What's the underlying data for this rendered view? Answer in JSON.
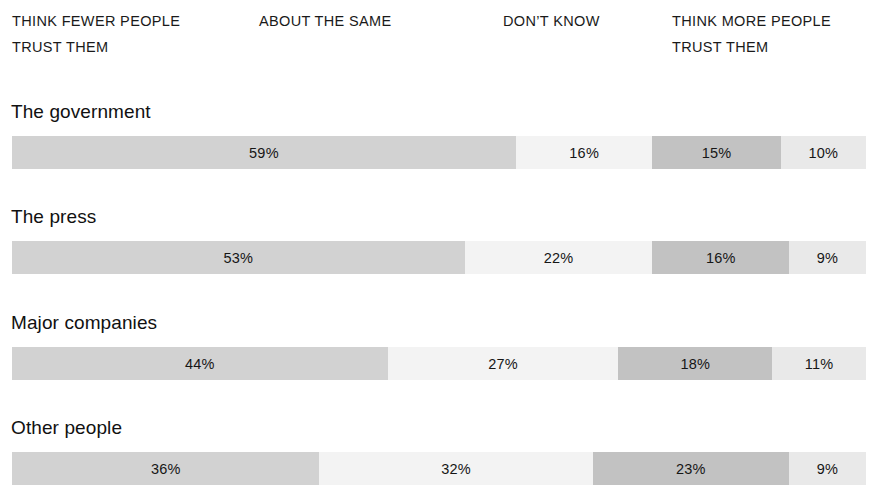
{
  "chart_data": {
    "type": "bar",
    "subtype": "stacked-horizontal-100pct",
    "title": "",
    "subtitle": "",
    "xlabel": "",
    "ylabel": "",
    "xlim": [
      0,
      100
    ],
    "grid": false,
    "legend_position": "top",
    "value_suffix": "%",
    "categories": [
      "The government",
      "The press",
      "Major companies",
      "Other people"
    ],
    "series": [
      {
        "name": "THINK FEWER PEOPLE TRUST THEM",
        "values": [
          59,
          53,
          44,
          36
        ],
        "color": "#d2d2d2"
      },
      {
        "name": "ABOUT THE SAME",
        "values": [
          16,
          22,
          27,
          32
        ],
        "color": "#f3f3f3"
      },
      {
        "name": "DON'T KNOW",
        "values": [
          15,
          16,
          18,
          23
        ],
        "color": "#c2c2c2"
      },
      {
        "name": "THINK MORE PEOPLE TRUST THEM",
        "values": [
          10,
          9,
          11,
          9
        ],
        "color": "#e9e9e9"
      }
    ]
  },
  "column_headers": [
    {
      "line1": "THINK FEWER PEOPLE",
      "line2": "TRUST THEM"
    },
    {
      "line1": "ABOUT THE SAME",
      "line2": ""
    },
    {
      "line1": "DON’T KNOW",
      "line2": ""
    },
    {
      "line1": "THINK MORE PEOPLE",
      "line2": "TRUST THEM"
    }
  ],
  "rows": [
    {
      "label": "The government",
      "segments": [
        {
          "value_label": "59%",
          "value": 59
        },
        {
          "value_label": "16%",
          "value": 16
        },
        {
          "value_label": "15%",
          "value": 15
        },
        {
          "value_label": "10%",
          "value": 10
        }
      ]
    },
    {
      "label": "The press",
      "segments": [
        {
          "value_label": "53%",
          "value": 53
        },
        {
          "value_label": "22%",
          "value": 22
        },
        {
          "value_label": "16%",
          "value": 16
        },
        {
          "value_label": "9%",
          "value": 9
        }
      ]
    },
    {
      "label": "Major companies",
      "segments": [
        {
          "value_label": "44%",
          "value": 44
        },
        {
          "value_label": "27%",
          "value": 27
        },
        {
          "value_label": "18%",
          "value": 18
        },
        {
          "value_label": "11%",
          "value": 11
        }
      ]
    },
    {
      "label": "Other people",
      "segments": [
        {
          "value_label": "36%",
          "value": 36
        },
        {
          "value_label": "32%",
          "value": 32
        },
        {
          "value_label": "23%",
          "value": 23
        },
        {
          "value_label": "9%",
          "value": 9
        }
      ]
    }
  ],
  "colors": {
    "segment_think_fewer": "#d2d2d2",
    "segment_about_same": "#f3f3f3",
    "segment_dont_know": "#c2c2c2",
    "segment_think_more": "#e9e9e9",
    "text": "#1a1a1a",
    "background": "#ffffff"
  }
}
